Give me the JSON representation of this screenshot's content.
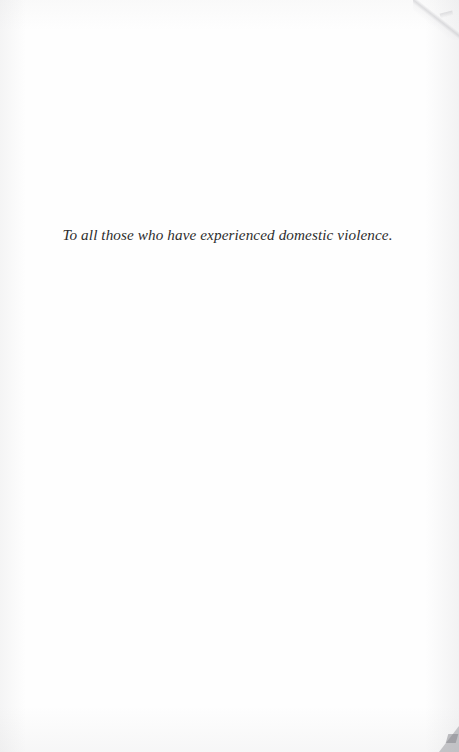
{
  "page": {
    "kind": "book-dedication-page",
    "background_color": "#fefefe",
    "width": 459,
    "height": 752
  },
  "dedication": {
    "text": "To all those who have experienced domestic violence.",
    "style": "italic-serif",
    "color": "#2d2d2d",
    "alignment": "center"
  },
  "artifacts": {
    "top_right_fold": "page-corner-fold-shadow",
    "bottom_right_mark": "page-corner-shadow-mark",
    "edge_shading": "scan-edge-gradient"
  }
}
